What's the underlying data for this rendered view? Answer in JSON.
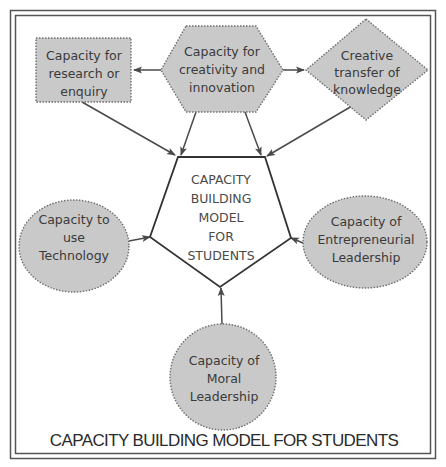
{
  "diagram": {
    "title": "CAPACITY BUILDING MODEL FOR STUDENTS",
    "colors": {
      "node_fill": "#c9c9c9",
      "node_border": "#6e6e6e",
      "text": "#3a3a3a",
      "arrow": "#4a4a4a",
      "frame": "#555555"
    },
    "center": {
      "shape": "pentagon",
      "lines": [
        "CAPACITY",
        "BUILDING",
        "MODEL",
        "FOR",
        "STUDENTS"
      ]
    },
    "nodes": {
      "research": {
        "shape": "rectangle",
        "lines": [
          "Capacity for",
          "research or",
          "enquiry"
        ]
      },
      "creativity": {
        "shape": "hexagon",
        "lines": [
          "Capacity for",
          "creativity and",
          "innovation"
        ]
      },
      "knowledge": {
        "shape": "diamond",
        "lines": [
          "Creative",
          "transfer of",
          "knowledge"
        ]
      },
      "technology": {
        "shape": "ellipse",
        "lines": [
          "Capacity to",
          "use",
          "Technology"
        ]
      },
      "entrepreneurial": {
        "shape": "ellipse",
        "lines": [
          "Capacity of",
          "Entrepreneurial",
          "Leadership"
        ]
      },
      "moral": {
        "shape": "circle",
        "lines": [
          "Capacity of",
          "Moral",
          "Leadership"
        ]
      }
    },
    "edges": [
      {
        "from": "Capacity for creativity and innovation",
        "to": "Capacity for research or enquiry"
      },
      {
        "from": "Capacity for creativity and innovation",
        "to": "Creative transfer of knowledge"
      },
      {
        "from": "Capacity for research or enquiry",
        "to": "CAPACITY BUILDING MODEL FOR STUDENTS"
      },
      {
        "from": "Capacity for creativity and innovation",
        "to": "CAPACITY BUILDING MODEL FOR STUDENTS"
      },
      {
        "from": "Capacity for creativity and innovation",
        "to": "CAPACITY BUILDING MODEL FOR STUDENTS"
      },
      {
        "from": "Creative transfer of knowledge",
        "to": "CAPACITY BUILDING MODEL FOR STUDENTS"
      },
      {
        "from": "Capacity to use Technology",
        "to": "CAPACITY BUILDING MODEL FOR STUDENTS"
      },
      {
        "from": "Capacity of Entrepreneurial Leadership",
        "to": "CAPACITY BUILDING MODEL FOR STUDENTS"
      },
      {
        "from": "Capacity of Moral Leadership",
        "to": "CAPACITY BUILDING MODEL FOR STUDENTS"
      }
    ]
  }
}
